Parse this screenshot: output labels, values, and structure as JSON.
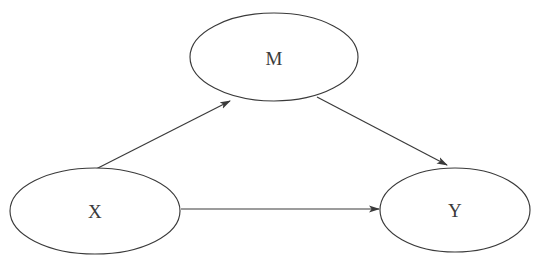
{
  "diagram": {
    "type": "mediation-model",
    "title": "",
    "background_color": "#ffffff",
    "stroke_color": "#3a3a3a",
    "label_color": "#3b3b3b",
    "nodes": [
      {
        "id": "M",
        "label": "M",
        "shape": "ellipse",
        "cx": 274,
        "cy": 57,
        "rx": 84,
        "ry": 44
      },
      {
        "id": "X",
        "label": "X",
        "shape": "ellipse",
        "cx": 95,
        "cy": 211,
        "rx": 85,
        "ry": 43
      },
      {
        "id": "Y",
        "label": "Y",
        "shape": "ellipse",
        "cx": 455,
        "cy": 210,
        "rx": 75,
        "ry": 42
      }
    ],
    "edges": [
      {
        "id": "x-to-m",
        "from": "X",
        "to": "M",
        "label": "",
        "arrow": "single",
        "x1": 96,
        "y1": 169,
        "x2": 232,
        "y2": 100
      },
      {
        "id": "m-to-y",
        "from": "M",
        "to": "Y",
        "label": "",
        "arrow": "single",
        "x1": 317,
        "y1": 97,
        "x2": 449,
        "y2": 166
      },
      {
        "id": "x-to-y",
        "from": "X",
        "to": "Y",
        "label": "",
        "arrow": "single",
        "x1": 181,
        "y1": 209,
        "x2": 380,
        "y2": 209
      }
    ]
  }
}
